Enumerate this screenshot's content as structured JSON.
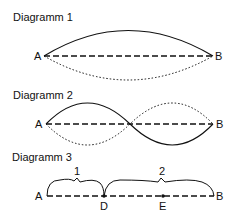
{
  "diagrams": [
    {
      "title": "Diagramm 1",
      "start": "A",
      "end": "B"
    },
    {
      "title": "Diagramm 2",
      "start": "A",
      "end": "B"
    },
    {
      "title": "Diagramm 3",
      "start": "A",
      "end": "B",
      "points": [
        "D",
        "E"
      ],
      "segment_labels": [
        "1",
        "2"
      ]
    }
  ],
  "colors": {
    "ink": "#111111",
    "background": "#ffffff"
  }
}
